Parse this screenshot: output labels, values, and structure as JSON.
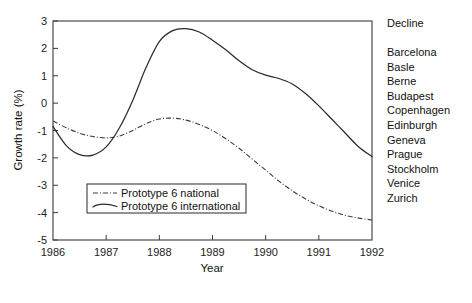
{
  "chart_data": {
    "type": "line",
    "title": "",
    "xlabel": "Year",
    "ylabel": "Growth rate (%)",
    "xlim": [
      1986,
      1992
    ],
    "ylim": [
      -5,
      3
    ],
    "xticks": [
      1986,
      1987,
      1988,
      1989,
      1990,
      1991,
      1992
    ],
    "xtick_labels": [
      "1986",
      "1987",
      "1988",
      "1989",
      "1990",
      "1991",
      "1992"
    ],
    "yticks": [
      -5,
      -4,
      -3,
      -2,
      -1,
      0,
      1,
      2,
      3
    ],
    "ytick_labels": [
      "-5",
      "-4",
      "-3",
      "-2",
      "-1",
      "0",
      "1",
      "2",
      "3"
    ],
    "grid": false,
    "legend_position": "lower-left-inside",
    "series": [
      {
        "name": "Prototype 6 national",
        "style": "dash-dot",
        "color": "#3a3a3a",
        "x": [
          1986.0,
          1986.25,
          1986.5,
          1986.75,
          1987.0,
          1987.25,
          1987.5,
          1987.75,
          1988.0,
          1988.25,
          1988.5,
          1988.75,
          1989.0,
          1989.25,
          1989.5,
          1989.75,
          1990.0,
          1990.25,
          1990.5,
          1990.75,
          1991.0,
          1991.25,
          1991.5,
          1991.75,
          1992.0
        ],
        "y": [
          -0.65,
          -0.9,
          -1.1,
          -1.22,
          -1.27,
          -1.2,
          -1.0,
          -0.75,
          -0.58,
          -0.55,
          -0.62,
          -0.78,
          -1.0,
          -1.3,
          -1.65,
          -2.05,
          -2.45,
          -2.85,
          -3.2,
          -3.5,
          -3.75,
          -3.95,
          -4.1,
          -4.2,
          -4.27
        ]
      },
      {
        "name": "Prototype 6 international",
        "style": "solid",
        "color": "#2b2b2b",
        "x": [
          1986.0,
          1986.25,
          1986.5,
          1986.75,
          1987.0,
          1987.25,
          1987.5,
          1987.75,
          1988.0,
          1988.25,
          1988.5,
          1988.75,
          1989.0,
          1989.25,
          1989.5,
          1989.75,
          1990.0,
          1990.25,
          1990.5,
          1990.75,
          1991.0,
          1991.25,
          1991.5,
          1991.75,
          1992.0
        ],
        "y": [
          -0.85,
          -1.55,
          -1.88,
          -1.9,
          -1.6,
          -0.9,
          0.1,
          1.3,
          2.25,
          2.65,
          2.72,
          2.6,
          2.3,
          1.95,
          1.55,
          1.22,
          1.02,
          0.9,
          0.7,
          0.35,
          -0.1,
          -0.6,
          -1.1,
          -1.6,
          -1.95
        ]
      }
    ],
    "annotations": {
      "side_list_title": "Decline",
      "side_list_items": [
        "Barcelona",
        "Basle",
        "Berne",
        "Budapest",
        "Copenhagen",
        "Edinburgh",
        "Geneva",
        "Prague",
        "Stockholm",
        "Venice",
        "Zurich"
      ]
    },
    "colors": {
      "background": "#ffffff",
      "axis": "#3b3b3b",
      "text": "#111111"
    }
  }
}
